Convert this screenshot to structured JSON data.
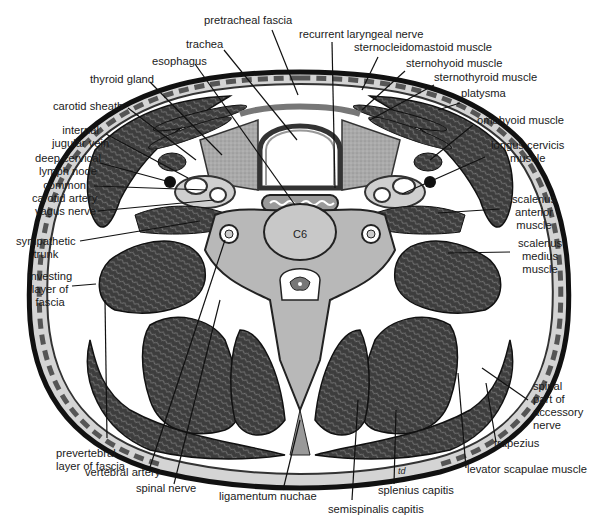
{
  "figure": {
    "vertebra_label": "C6",
    "signature": "td",
    "colors": {
      "muscle": "#4a4a4a",
      "fascia": "#9a9a9a",
      "bone": "#b8b8b8",
      "thyroid": "#a8a8a8",
      "background": "#ffffff",
      "outline": "#111111",
      "skin": "#d6d6d6"
    }
  },
  "labels": {
    "pretracheal_fascia": "pretracheal fascia",
    "trachea": "trachea",
    "esophagus": "esophagus",
    "thyroid_gland": "thyroid gland",
    "carotid_sheath": "carotid sheath",
    "internal_jugular_vein": "internal\njugular vein",
    "deep_cervical_lymph_node": "deep cervical\nlymph node",
    "common_carotid_artery": "common\ncarotid artery",
    "vagus_nerve": "vagus nerve",
    "sympathetic_trunk": "sympathetic\ntrunk",
    "investing_layer_of_fascia": "investing\nlayer of\nfascia",
    "prevertebral_layer_of_fascia": "prevertebral\nlayer of fascia",
    "vertebral_artery": "vertebral artery",
    "spinal_nerve": "spinal nerve",
    "ligamentum_nuchae": "ligamentum nuchae",
    "semispinalis_capitis": "semispinalis capitis",
    "splenius_capitis": "splenius capitis",
    "levator_scapulae_muscle": "levator scapulae muscle",
    "trapezius": "trapezius",
    "spinal_part_of_accessory_nerve": "spinal\npart of\naccessory\nnerve",
    "scalenus_medius_muscle": "scalenus\nmedius\nmuscle",
    "scalenus_anterior_muscle": "scalenus\nanterior\nmuscle",
    "longus_cervicis_muscle": "longus cervicis\nmuscle",
    "omohyoid_muscle": "omohyoid muscle",
    "platysma": "platysma",
    "sternothyroid_muscle": "sternothyroid muscle",
    "sternohyoid_muscle": "sternohyoid muscle",
    "sternocleidomastoid_muscle": "sternocleidomastoid muscle",
    "recurrent_laryngeal_nerve": "recurrent laryngeal nerve"
  }
}
